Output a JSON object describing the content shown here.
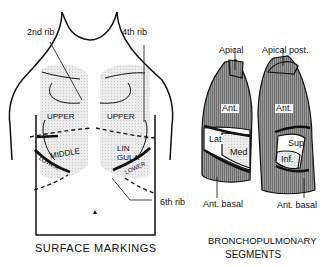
{
  "surface_markings": {
    "caption": "SURFACE MARKINGS",
    "labels": {
      "rib2": "2nd rib",
      "rib4": "4th rib",
      "rib6": "6th rib",
      "upper_right": "UPPER",
      "upper_left": "UPPER",
      "middle": "MIDDLE",
      "lower_right": "LOWER",
      "lingula": "LIN GULA",
      "lower_left": "LOWER"
    }
  },
  "bronchopulmonary": {
    "caption_line1": "BRONCHOPULMONARY",
    "caption_line2": "SEGMENTS",
    "labels": {
      "apical": "Apical",
      "apical_post": "Apical post.",
      "ant_right": "Ant.",
      "ant_left": "Ant.",
      "lat": "Lat",
      "med": "Med",
      "sup": "Sup",
      "inf": "Inf.",
      "ant_basal_right": "Ant. basal",
      "ant_basal_left": "Ant. basal"
    }
  },
  "colors": {
    "segment_fill": "#8a8a8a",
    "lobe_fill": "#e4e4e4",
    "line": "#111111"
  }
}
